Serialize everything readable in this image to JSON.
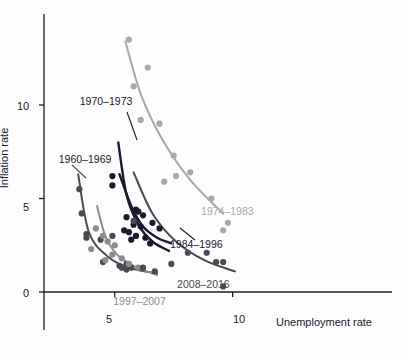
{
  "chart_data": {
    "type": "scatter",
    "title": "",
    "xlabel": "Unemployment rate",
    "ylabel": "Inflation rate",
    "xlim": [
      2.0,
      11.5
    ],
    "ylim": [
      -1.5,
      14.5
    ],
    "xticks": [
      5,
      10
    ],
    "yticks": [
      0,
      5,
      10
    ],
    "grid": false,
    "legend_position": "inline-annotations",
    "series": [
      {
        "name": "1960–1969",
        "color": "#4a4a52",
        "label_x": 3.05,
        "label_y": 7.0,
        "points": [
          {
            "x": 5.5,
            "y": 1.5
          },
          {
            "x": 6.7,
            "y": 1.1
          },
          {
            "x": 5.5,
            "y": 1.2
          },
          {
            "x": 5.7,
            "y": 1.3
          },
          {
            "x": 5.2,
            "y": 1.4
          },
          {
            "x": 4.5,
            "y": 1.6
          },
          {
            "x": 3.8,
            "y": 2.9
          },
          {
            "x": 3.8,
            "y": 3.1
          },
          {
            "x": 3.6,
            "y": 4.2
          },
          {
            "x": 3.5,
            "y": 5.5
          },
          {
            "x": 4.9,
            "y": 3.0
          },
          {
            "x": 4.4,
            "y": 2.8
          }
        ],
        "curve": [
          {
            "x": 3.45,
            "y": 6.3
          },
          {
            "x": 3.9,
            "y": 3.2
          },
          {
            "x": 4.7,
            "y": 1.9
          },
          {
            "x": 5.6,
            "y": 1.3
          },
          {
            "x": 6.8,
            "y": 1.0
          }
        ]
      },
      {
        "name": "1970–1973",
        "color": "#1a1a2e",
        "label_x": 4.45,
        "label_y": 10.1,
        "points": [
          {
            "x": 4.9,
            "y": 5.7
          },
          {
            "x": 5.9,
            "y": 4.4
          },
          {
            "x": 5.6,
            "y": 3.2
          },
          {
            "x": 4.9,
            "y": 6.2
          }
        ],
        "curve": [
          {
            "x": 5.15,
            "y": 8.0
          },
          {
            "x": 5.5,
            "y": 5.2
          },
          {
            "x": 6.0,
            "y": 3.6
          },
          {
            "x": 6.6,
            "y": 2.7
          },
          {
            "x": 7.3,
            "y": 2.2
          }
        ]
      },
      {
        "name": "1974–1983",
        "color": "#a8a8a8",
        "label_x": 9.0,
        "label_y": 4.3,
        "points": [
          {
            "x": 5.6,
            "y": 13.5
          },
          {
            "x": 6.4,
            "y": 12.0
          },
          {
            "x": 5.8,
            "y": 11.0
          },
          {
            "x": 6.1,
            "y": 9.2
          },
          {
            "x": 6.9,
            "y": 9.0
          },
          {
            "x": 7.5,
            "y": 7.3
          },
          {
            "x": 8.2,
            "y": 6.4
          },
          {
            "x": 7.1,
            "y": 5.9
          },
          {
            "x": 9.1,
            "y": 5.0
          },
          {
            "x": 9.8,
            "y": 3.7
          },
          {
            "x": 9.6,
            "y": 3.3
          },
          {
            "x": 7.6,
            "y": 6.2
          }
        ],
        "curve": [
          {
            "x": 5.45,
            "y": 13.4
          },
          {
            "x": 6.1,
            "y": 10.6
          },
          {
            "x": 7.0,
            "y": 8.2
          },
          {
            "x": 8.2,
            "y": 6.0
          },
          {
            "x": 9.6,
            "y": 4.2
          }
        ]
      },
      {
        "name": "1984–1996",
        "color": "#1a1a2e",
        "label_x": 7.6,
        "label_y": 2.5,
        "points": [
          {
            "x": 6.0,
            "y": 4.3
          },
          {
            "x": 6.2,
            "y": 4.1
          },
          {
            "x": 5.5,
            "y": 4.0
          },
          {
            "x": 6.6,
            "y": 3.7
          },
          {
            "x": 5.8,
            "y": 3.6
          },
          {
            "x": 6.1,
            "y": 3.5
          },
          {
            "x": 6.9,
            "y": 3.4
          },
          {
            "x": 5.9,
            "y": 3.0
          },
          {
            "x": 6.3,
            "y": 2.9
          },
          {
            "x": 5.7,
            "y": 2.8
          },
          {
            "x": 6.5,
            "y": 2.6
          },
          {
            "x": 5.4,
            "y": 3.3
          }
        ],
        "curve": [
          {
            "x": 5.2,
            "y": 6.3
          },
          {
            "x": 5.7,
            "y": 4.6
          },
          {
            "x": 6.2,
            "y": 3.5
          },
          {
            "x": 6.8,
            "y": 2.9
          },
          {
            "x": 7.4,
            "y": 2.6
          }
        ]
      },
      {
        "name": "1997–2007",
        "color": "#8c8c8c",
        "label_x": 5.7,
        "label_y": -0.55,
        "points": [
          {
            "x": 4.2,
            "y": 3.4
          },
          {
            "x": 4.5,
            "y": 3.0
          },
          {
            "x": 4.0,
            "y": 2.3
          },
          {
            "x": 4.7,
            "y": 2.7
          },
          {
            "x": 5.0,
            "y": 2.5
          },
          {
            "x": 4.9,
            "y": 2.0
          },
          {
            "x": 5.3,
            "y": 1.8
          },
          {
            "x": 5.6,
            "y": 1.5
          },
          {
            "x": 6.0,
            "y": 1.3
          },
          {
            "x": 4.6,
            "y": 1.7
          }
        ],
        "curve": [
          {
            "x": 4.25,
            "y": 4.6
          },
          {
            "x": 4.6,
            "y": 3.0
          },
          {
            "x": 5.1,
            "y": 2.0
          },
          {
            "x": 5.8,
            "y": 1.4
          },
          {
            "x": 6.8,
            "y": 0.9
          }
        ]
      },
      {
        "name": "2008–2016",
        "color": "#4a4a52",
        "label_x": 7.9,
        "label_y": 0.35,
        "points": [
          {
            "x": 5.8,
            "y": 3.8
          },
          {
            "x": 9.3,
            "y": 1.6
          },
          {
            "x": 9.6,
            "y": 1.6
          },
          {
            "x": 8.9,
            "y": 2.1
          },
          {
            "x": 8.1,
            "y": 2.1
          },
          {
            "x": 7.4,
            "y": 1.5
          },
          {
            "x": 6.2,
            "y": 1.3
          },
          {
            "x": 5.3,
            "y": 1.3
          },
          {
            "x": 9.6,
            "y": 0.3
          }
        ],
        "curve": [
          {
            "x": 5.8,
            "y": 6.4
          },
          {
            "x": 6.6,
            "y": 4.2
          },
          {
            "x": 7.6,
            "y": 2.7
          },
          {
            "x": 8.8,
            "y": 1.7
          },
          {
            "x": 10.1,
            "y": 1.1
          }
        ]
      }
    ]
  },
  "axes": {
    "x_title": "Unemployment rate",
    "y_title": "Inflation rate",
    "x_tick_labels": [
      "5",
      "10"
    ],
    "y_tick_labels": [
      "0",
      "5",
      "10"
    ]
  },
  "labels": {
    "s1960": "1960–1969",
    "s1970": "1970–1973",
    "s1974": "1974–1983",
    "s1984": "1984–1996",
    "s1997": "1997–2007",
    "s2008": "2008–2016"
  },
  "colors": {
    "axis": "#1a1a2e",
    "dark": "#1a1a2e",
    "darkgray": "#4a4a52",
    "midgray": "#8c8c8c",
    "lightgray": "#a8a8a8",
    "background": "#fdfdfd"
  }
}
